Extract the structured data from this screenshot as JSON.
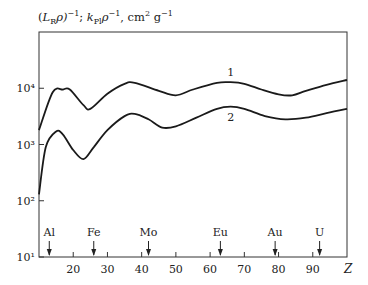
{
  "chart_data": {
    "type": "line",
    "title": "",
    "ylabel": "(L_R ρ)^-1; k_Pl ρ^-1, cm² g^-1",
    "xlabel": "Z",
    "yscale": "log",
    "xlim": [
      10,
      100
    ],
    "ylim": [
      10,
      100000
    ],
    "grid": false,
    "x_ticks": [
      20,
      30,
      40,
      50,
      60,
      70,
      80,
      90
    ],
    "x_tick_labels": [
      "20",
      "30",
      "40",
      "50",
      "60",
      "70",
      "80",
      "90"
    ],
    "y_ticks": [
      10,
      100,
      1000,
      10000
    ],
    "y_tick_labels": [
      "10¹",
      "10²",
      "10³",
      "10⁴"
    ],
    "series": [
      {
        "name": "1",
        "x": [
          10,
          14,
          17,
          19,
          23,
          25,
          30,
          35,
          38,
          45,
          50,
          55,
          62,
          66,
          70,
          75,
          80,
          84,
          88,
          94,
          100
        ],
        "y": [
          1800,
          8500,
          9500,
          9500,
          5000,
          4300,
          8000,
          12000,
          12500,
          9000,
          7500,
          9500,
          12500,
          12800,
          12000,
          9500,
          7800,
          7500,
          9000,
          11500,
          14000
        ]
      },
      {
        "name": "2",
        "x": [
          10,
          12,
          15,
          17,
          20,
          23,
          26,
          30,
          35,
          38,
          42,
          46,
          50,
          56,
          62,
          66,
          70,
          76,
          82,
          88,
          94,
          100
        ],
        "y": [
          130,
          900,
          1700,
          1500,
          800,
          550,
          900,
          1800,
          3200,
          3500,
          2800,
          2000,
          2100,
          3000,
          4300,
          4700,
          4300,
          3200,
          2800,
          3000,
          3600,
          4300
        ]
      }
    ],
    "annotations": [
      {
        "label": "Al",
        "x": 13
      },
      {
        "label": "Fe",
        "x": 26
      },
      {
        "label": "Mo",
        "x": 42
      },
      {
        "label": "Eu",
        "x": 63
      },
      {
        "label": "Au",
        "x": 79
      },
      {
        "label": "U",
        "x": 92
      }
    ],
    "curve_labels": [
      {
        "text": "1",
        "x": 66,
        "y": 16500
      },
      {
        "text": "2",
        "x": 66,
        "y": 2600
      }
    ]
  },
  "header": {
    "ylabel_parts": {
      "open": "(",
      "L": "L",
      "R": "R",
      "rho1": "ρ)",
      "exp1": "−1",
      "sep": "; ",
      "k": "k",
      "Pl": "Pl",
      "rho2": "ρ",
      "exp2": "−1",
      "unit": ", cm",
      "sq": "2",
      "g": " g",
      "exp3": "−1"
    }
  }
}
